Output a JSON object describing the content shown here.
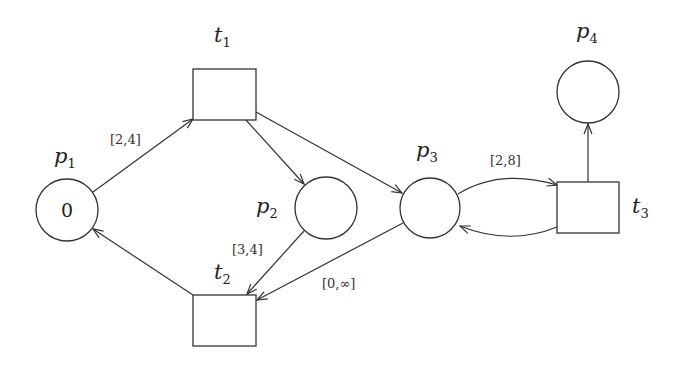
{
  "diagram": {
    "type": "time-petri-net",
    "places": [
      {
        "id": "p1",
        "label": "p",
        "sub": "1",
        "tokens": "0"
      },
      {
        "id": "p2",
        "label": "p",
        "sub": "2",
        "tokens": ""
      },
      {
        "id": "p3",
        "label": "p",
        "sub": "3",
        "tokens": ""
      },
      {
        "id": "p4",
        "label": "p",
        "sub": "4",
        "tokens": ""
      }
    ],
    "transitions": [
      {
        "id": "t1",
        "label": "t",
        "sub": "1",
        "interval": "[2,4]"
      },
      {
        "id": "t2",
        "label": "t",
        "sub": "2",
        "interval": "[3,4]"
      },
      {
        "id": "t3",
        "label": "t",
        "sub": "3",
        "interval": "[2,8]"
      }
    ],
    "extra_intervals": [
      {
        "near": "p3-t2 arc",
        "text": "[0,∞]"
      }
    ],
    "arcs": [
      {
        "from": "p1",
        "to": "t1"
      },
      {
        "from": "t1",
        "to": "p2"
      },
      {
        "from": "t1",
        "to": "p3"
      },
      {
        "from": "p2",
        "to": "t2"
      },
      {
        "from": "p3",
        "to": "t2"
      },
      {
        "from": "t2",
        "to": "p1"
      },
      {
        "from": "p3",
        "to": "t3"
      },
      {
        "from": "t3",
        "to": "p3"
      },
      {
        "from": "t3",
        "to": "p4"
      }
    ]
  }
}
